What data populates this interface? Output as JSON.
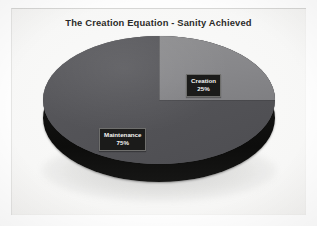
{
  "slide": {
    "title": "The Creation Equation - Sanity Achieved",
    "background_color": "#f7f7f6"
  },
  "chart_data": {
    "type": "pie",
    "title": "The Creation Equation - Sanity Achieved",
    "xlabel": "",
    "ylabel": "",
    "categories": [
      "Creation",
      "Maintenance"
    ],
    "values": [
      25,
      75
    ],
    "value_unit": "%",
    "labels": [
      {
        "name": "Creation",
        "value": 25,
        "display_value": "25%",
        "color": "#87878a",
        "position": "upper-right"
      },
      {
        "name": "Maintenance",
        "value": 75,
        "display_value": "75%",
        "color": "#54545 8",
        "position": "left-lower"
      }
    ],
    "legend": "none",
    "grid": false,
    "style": "3d-exploded-disc",
    "depth_color": "#121211",
    "label_box_color": "#1b1b1a",
    "label_text_color": "#f4f4f2"
  },
  "labels": {
    "creation": {
      "name": "Creation",
      "percent": "25%"
    },
    "maintenance": {
      "name": "Maintenance",
      "percent": "75%"
    }
  }
}
